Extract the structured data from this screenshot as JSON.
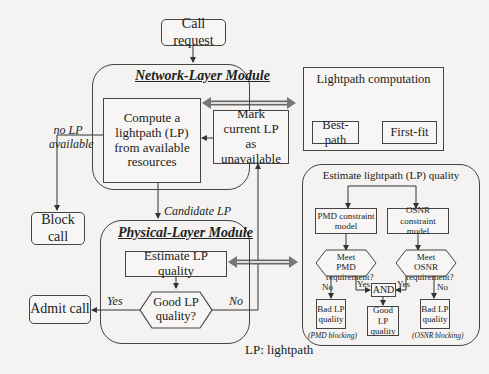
{
  "diagram": {
    "call_request": "Call request",
    "network_module": {
      "title": "Network-Layer Module",
      "compute": "Compute a lightpath (LP) from available resources",
      "mark": "Mark current LP as unavailable"
    },
    "no_lp_label": "no LP available",
    "block_call": "Block call",
    "candidate_lp": "Candidate LP",
    "physical_module": {
      "title": "Physical-Layer Module",
      "estimate": "Estimate LP quality",
      "decision": "Good LP quality?"
    },
    "yes_label": "Yes",
    "no_label": "No",
    "admit_call": "Admit call",
    "legend": "LP: lightpath",
    "lightpath_computation": {
      "title": "Lightpath computation",
      "best_path": "Best-path",
      "first_fit": "First-fit"
    },
    "quality_panel": {
      "title": "Estimate lightpath (LP) quality",
      "pmd_model": "PMD constraint model",
      "osnr_model": "OSNR constraint model",
      "pmd_decision": "Meet PMD requirement?",
      "osnr_decision": "Meet OSNR requirement?",
      "and": "AND",
      "yes": "Yes",
      "no": "No",
      "bad_pmd": "Bad LP quality",
      "bad_osnr": "Bad LP quality",
      "good": "Good LP quality",
      "pmd_blocking": "(PMD blocking)",
      "osnr_blocking": "(OSNR blocking)"
    }
  }
}
